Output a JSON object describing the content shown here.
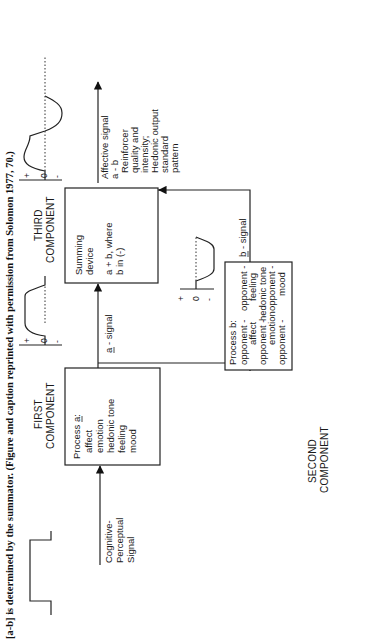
{
  "caption": "[a-b] is determined by the summator. (Figure and caption reprinted with permission from Solomon 1977, 70.)",
  "input": {
    "label_lines": [
      "Cognitive-",
      "Perceptual",
      "Signal"
    ]
  },
  "first_component": {
    "header_lines": [
      "FIRST",
      "COMPONENT"
    ],
    "process_title": "Process a:",
    "process_title_underline": "a",
    "items": [
      "affect",
      "emotion",
      "hedonic tone",
      "feeling",
      "mood"
    ],
    "axis": {
      "plus": "+",
      "zero": "0",
      "minus": "-"
    }
  },
  "a_signal": {
    "label": "a - signal"
  },
  "third_component": {
    "header_lines": [
      "THIRD",
      "COMPONENT"
    ],
    "box_lines": [
      "Summing",
      "device",
      "a + b, where",
      "b in (-)"
    ]
  },
  "second_component": {
    "header_lines": [
      "SECOND",
      "COMPONENT"
    ],
    "process_title": "Process b:",
    "items": [
      "opponent -",
      "affect",
      "opponent -",
      "emotion",
      "opponent -",
      "hedonic tone",
      "opponent -",
      "feeling",
      "opponent -",
      "mood"
    ],
    "axis": {
      "plus": "+",
      "zero": "0",
      "minus": "-"
    }
  },
  "b_signal": {
    "label": "b - signal"
  },
  "output": {
    "label_lines": [
      "Affective signal",
      "a - b",
      "Reinforcer",
      "quality and",
      "intensity;",
      "Hedonic output",
      "standard",
      "pattern"
    ],
    "axis": {
      "plus": "+",
      "zero": "0",
      "minus": "-"
    }
  }
}
